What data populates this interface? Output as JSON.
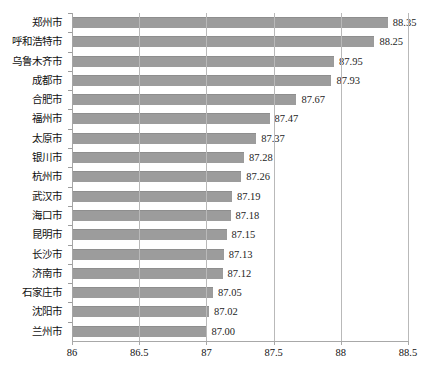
{
  "chart_data": {
    "type": "bar",
    "orientation": "horizontal",
    "title": "",
    "xlabel": "",
    "ylabel": "",
    "xlim": [
      86,
      88.5
    ],
    "xticks": [
      "86",
      "86.5",
      "87",
      "87.5",
      "88",
      "88.5"
    ],
    "xtick_values": [
      86,
      86.5,
      87,
      87.5,
      88,
      88.5
    ],
    "grid": true,
    "legend": false,
    "bar_color": "#9c9c9c",
    "categories": [
      "郑州市",
      "呼和浩特市",
      "乌鲁木齐市",
      "成都市",
      "合肥市",
      "福州市",
      "太原市",
      "银川市",
      "杭州市",
      "武汉市",
      "海口市",
      "昆明市",
      "长沙市",
      "济南市",
      "石家庄市",
      "沈阳市",
      "兰州市"
    ],
    "values": [
      88.35,
      88.25,
      87.95,
      87.93,
      87.67,
      87.47,
      87.37,
      87.28,
      87.26,
      87.19,
      87.18,
      87.15,
      87.13,
      87.12,
      87.05,
      87.02,
      87.0
    ],
    "value_labels": [
      "88.35",
      "88.25",
      "87.95",
      "87.93",
      "87.67",
      "87.47",
      "87.37",
      "87.28",
      "87.26",
      "87.19",
      "87.18",
      "87.15",
      "87.13",
      "87.12",
      "87.05",
      "87.02",
      "87.00"
    ]
  }
}
